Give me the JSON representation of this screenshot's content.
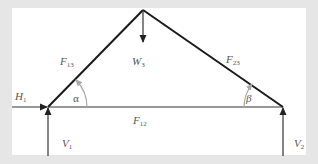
{
  "diagram": {
    "colors": {
      "background": "#e6e6e6",
      "panel": "#ffffff",
      "member": "#1a1a1a",
      "force": "#333333",
      "angle_arc": "#a8a8a8",
      "label": "#555555"
    },
    "members": [
      {
        "id": "F13",
        "from": "joint-1",
        "to": "joint-3"
      },
      {
        "id": "F23",
        "from": "joint-2",
        "to": "joint-3"
      },
      {
        "id": "F12",
        "from": "joint-1",
        "to": "joint-2"
      }
    ],
    "labels": {
      "F13": {
        "main": "F",
        "sub": "13"
      },
      "F23": {
        "main": "F",
        "sub": "23"
      },
      "F12": {
        "main": "F",
        "sub": "12"
      },
      "W3": {
        "main": "W",
        "sub": "3"
      },
      "H1": {
        "main": "H",
        "sub": "1"
      },
      "V1": {
        "main": "V",
        "sub": "1"
      },
      "V2": {
        "main": "V",
        "sub": "2"
      },
      "alpha": "α",
      "beta": "β"
    },
    "forces": [
      {
        "id": "H1",
        "direction": "right",
        "joint": "joint-1"
      },
      {
        "id": "V1",
        "direction": "up",
        "joint": "joint-1"
      },
      {
        "id": "V2",
        "direction": "up",
        "joint": "joint-2"
      },
      {
        "id": "W3",
        "direction": "down",
        "joint": "joint-3"
      }
    ],
    "angles": [
      {
        "id": "alpha",
        "joint": "joint-1"
      },
      {
        "id": "beta",
        "joint": "joint-2"
      }
    ]
  }
}
